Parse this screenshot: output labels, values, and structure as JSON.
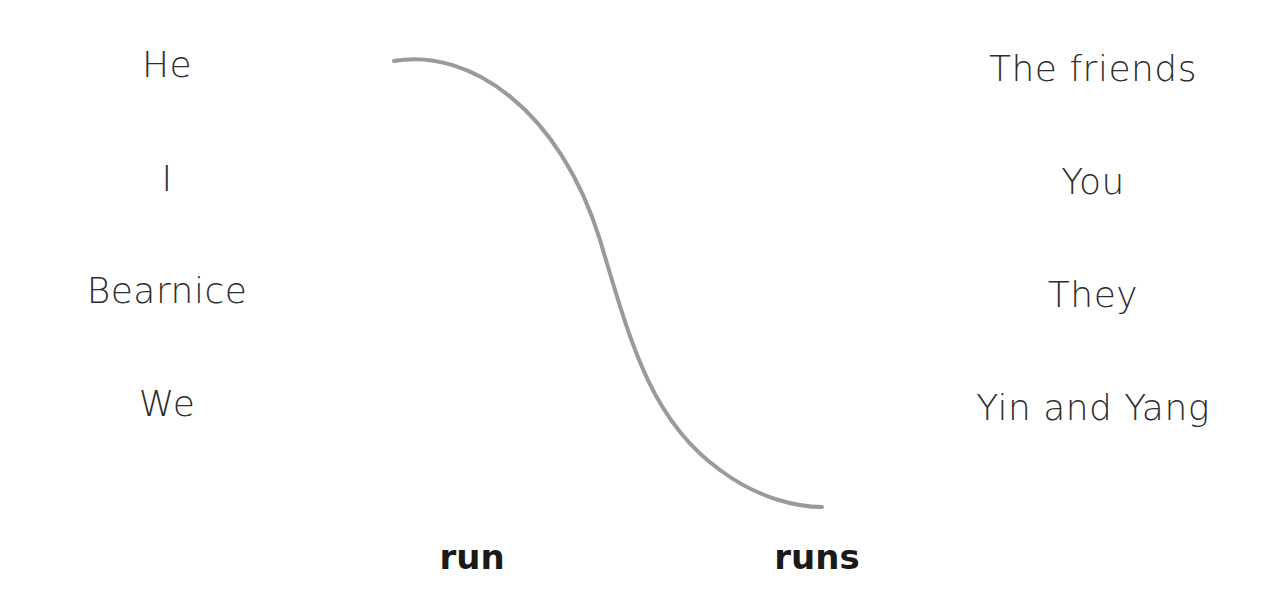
{
  "worksheet": {
    "left_subjects": [
      {
        "label": "He"
      },
      {
        "label": "I"
      },
      {
        "label": "Bearnice"
      },
      {
        "label": "We"
      }
    ],
    "right_subjects": [
      {
        "label": "The friends"
      },
      {
        "label": "You"
      },
      {
        "label": "They"
      },
      {
        "label": "Yin and Yang"
      }
    ],
    "verbs": [
      {
        "label": "run"
      },
      {
        "label": "runs"
      }
    ],
    "connections": [
      {
        "from": "He",
        "to": "runs",
        "color": "#9a9a9a"
      }
    ]
  }
}
